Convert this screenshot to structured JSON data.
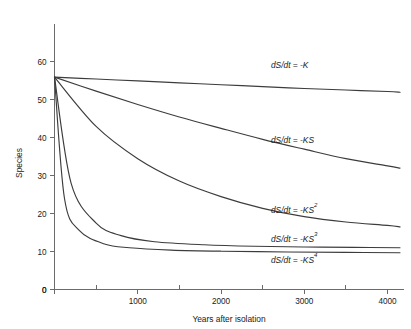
{
  "chart_data": {
    "type": "line",
    "title": "",
    "xlabel": "Years after isolation",
    "ylabel": "Species",
    "xlim": [
      0,
      4150
    ],
    "ylim": [
      0,
      65
    ],
    "grid": false,
    "legend": "inline-curve-labels",
    "x_ticks_major": [
      0,
      1000,
      2000,
      3000,
      4000
    ],
    "x_tick_labels": [
      "0",
      "1000",
      "2000",
      "3000",
      "4000"
    ],
    "x_ticks_minor": [
      500,
      1500,
      2500,
      3500
    ],
    "y_ticks": [
      0,
      10,
      20,
      30,
      40,
      50,
      60
    ],
    "y_tick_labels": [
      "0",
      "10",
      "20",
      "30",
      "40",
      "50",
      "60"
    ],
    "initial_species": 56,
    "series": [
      {
        "name": "dS/dt = -K",
        "label_main": "dS/dt = -K",
        "label_base": "dS/dt = -K",
        "exponent": "",
        "x": [
          0,
          500,
          1000,
          1500,
          2000,
          2500,
          3000,
          3500,
          4000,
          4150
        ],
        "values": [
          56.0,
          55.5,
          55.0,
          54.5,
          54.0,
          53.5,
          53.0,
          52.6,
          52.2,
          52.0
        ]
      },
      {
        "name": "dS/dt = -KS",
        "label_main": "dS/dt = -KS",
        "label_base": "dS/dt = -KS",
        "exponent": "",
        "x": [
          0,
          500,
          1000,
          1500,
          2000,
          2500,
          3000,
          3500,
          4000,
          4150
        ],
        "values": [
          56.0,
          52.3,
          48.8,
          45.5,
          42.5,
          39.6,
          37.0,
          34.5,
          32.6,
          32.0
        ]
      },
      {
        "name": "dS/dt = -KS2",
        "label_main": "dS/dt = -KS2",
        "label_base": "dS/dt = -KS",
        "exponent": "2",
        "x": [
          0,
          500,
          1000,
          1500,
          2000,
          2500,
          3000,
          3500,
          4000,
          4150
        ],
        "values": [
          56.0,
          43.0,
          34.5,
          28.6,
          24.5,
          21.4,
          19.2,
          17.8,
          16.9,
          16.5
        ]
      },
      {
        "name": "dS/dt = -KS3",
        "label_main": "dS/dt = -KS3",
        "label_base": "dS/dt = -KS",
        "exponent": "3",
        "x": [
          0,
          200,
          500,
          800,
          1200,
          1800,
          2400,
          3000,
          3600,
          4150
        ],
        "values": [
          56.0,
          28.0,
          17.5,
          14.2,
          12.6,
          11.8,
          11.4,
          11.2,
          11.1,
          11.0
        ]
      },
      {
        "name": "dS/dt = -KS4",
        "label_main": "dS/dt = -KS4",
        "label_base": "dS/dt = -KS",
        "exponent": "4",
        "x": [
          0,
          120,
          300,
          600,
          900,
          1400,
          2000,
          2800,
          3500,
          4150
        ],
        "values": [
          56.0,
          24.0,
          15.5,
          12.0,
          11.0,
          10.4,
          10.1,
          9.9,
          9.8,
          9.7
        ]
      }
    ],
    "annotations": [
      {
        "text": "dS/dt = -K",
        "base": "dS/dt = -K",
        "exponent": "",
        "x": 2600,
        "y": 58.5
      },
      {
        "text": "dS/dt = -KS",
        "base": "dS/dt = -KS",
        "exponent": "",
        "x": 2600,
        "y": 38.5
      },
      {
        "text": "dS/dt = -KS2",
        "base": "dS/dt = -KS",
        "exponent": "2",
        "x": 2600,
        "y": 20.3
      },
      {
        "text": "dS/dt = -KS3",
        "base": "dS/dt = -KS",
        "exponent": "3",
        "x": 2600,
        "y": 12.4
      },
      {
        "text": "dS/dt = -KS4",
        "base": "dS/dt = -KS",
        "exponent": "4",
        "x": 2600,
        "y": 6.9
      }
    ]
  }
}
